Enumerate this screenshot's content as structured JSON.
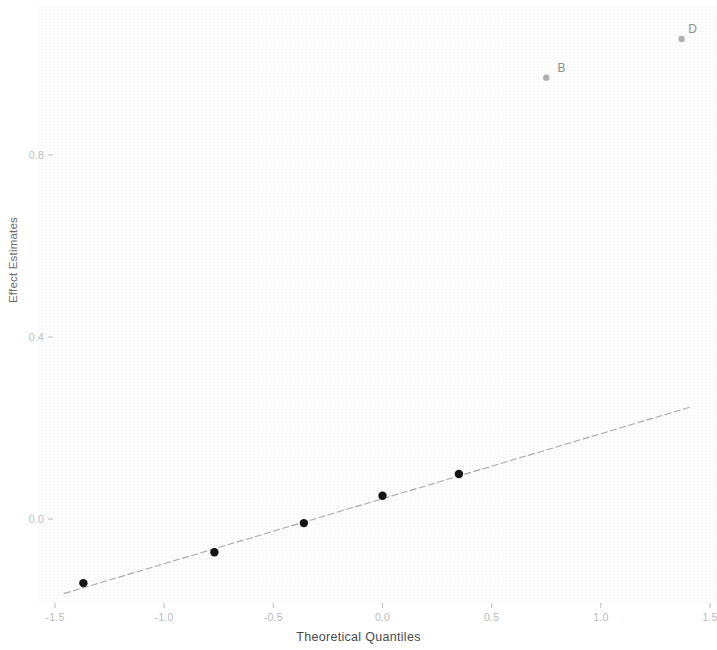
{
  "chart_data": {
    "type": "scatter",
    "title": "",
    "xlabel": "Theoretical Quantiles",
    "ylabel": "Effect Estimates",
    "xlim": [
      -1.58,
      1.62
    ],
    "ylim": [
      -0.22,
      1.12
    ],
    "xticks": [
      -1.5,
      -1.0,
      -0.5,
      0.0,
      0.5,
      1.0,
      1.5
    ],
    "xticklabels": [
      "-1.5",
      "-1.0",
      "-0.5",
      "0.0",
      "0.5",
      "1.0",
      "1.5"
    ],
    "yticks": [
      0.0,
      0.4,
      0.8
    ],
    "yticklabels": [
      "0.0",
      "0.4",
      "0.8"
    ],
    "grid": false,
    "legend": "none",
    "series": [
      {
        "name": "unlabeled-effects",
        "marker": "filled-circle",
        "color": "#151515",
        "size": 6,
        "points": [
          {
            "x": -1.37,
            "y": -0.141,
            "label": ""
          },
          {
            "x": -0.77,
            "y": -0.073,
            "label": ""
          },
          {
            "x": -0.36,
            "y": -0.009,
            "label": ""
          },
          {
            "x": 0.0,
            "y": 0.051,
            "label": ""
          },
          {
            "x": 0.35,
            "y": 0.099,
            "label": ""
          }
        ]
      },
      {
        "name": "labeled-outliers",
        "marker": "filled-circle",
        "color": "#b0b0b0",
        "size": 4,
        "points": [
          {
            "x": 0.75,
            "y": 0.97,
            "label": "B"
          },
          {
            "x": 1.37,
            "y": 1.055,
            "label": "D"
          }
        ]
      }
    ],
    "reference_line": {
      "name": "qq-reference-line",
      "color": "#a8a8a8",
      "x_start": -1.46,
      "y_start": -0.164,
      "x_end": 1.41,
      "y_end": 0.246
    },
    "annotations": [
      {
        "text": "B",
        "x": 0.82,
        "y": 0.992
      },
      {
        "text": "D",
        "x": 1.42,
        "y": 1.077
      }
    ]
  },
  "axes": {
    "x_title": "Theoretical Quantiles",
    "y_title": "Effect Estimates"
  },
  "colors": {
    "background": "#ffffff",
    "panel": "#fdfdfd",
    "point_dark": "#151515",
    "point_gray": "#b0b0b0",
    "line": "#a8a8a8",
    "tick_text": "#bbbbbb",
    "axis_title": "#4a4a4a"
  }
}
